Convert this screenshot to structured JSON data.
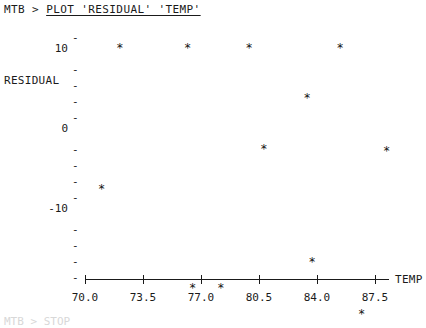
{
  "header": {
    "prompt": "MTB > ",
    "command": "PLOT 'RESIDUAL' 'TEMP'"
  },
  "footer": {
    "partial_text": "MTB > STOP"
  },
  "chart_data": {
    "type": "scatter",
    "title": "",
    "subtitle": "",
    "xlabel": "TEMP",
    "ylabel": "RESIDUAL",
    "marker": "*",
    "grid": false,
    "legend": null,
    "xlim": [
      70.0,
      89.0
    ],
    "ylim": [
      -17.0,
      14.0
    ],
    "xticks": [
      "70.0",
      "73.5",
      "77.0",
      "80.5",
      "84.0",
      "87.5"
    ],
    "xtick_values": [
      70.0,
      73.5,
      77.0,
      80.5,
      84.0,
      87.5
    ],
    "ytick_labels": [
      "10",
      "0",
      "-10"
    ],
    "ytick_values": [
      10,
      0,
      -10
    ],
    "ytick_dash_count": 16,
    "points": [
      {
        "x": 72.1,
        "y": 10.2
      },
      {
        "x": 76.2,
        "y": 10.2
      },
      {
        "x": 79.9,
        "y": 10.2
      },
      {
        "x": 85.4,
        "y": 10.2
      },
      {
        "x": 83.4,
        "y": 4.0
      },
      {
        "x": 80.8,
        "y": -2.4
      },
      {
        "x": 88.2,
        "y": -2.6
      },
      {
        "x": 71.0,
        "y": -7.4
      },
      {
        "x": 76.5,
        "y": -19.8
      },
      {
        "x": 78.2,
        "y": -19.8
      },
      {
        "x": 83.7,
        "y": -16.5
      },
      {
        "x": 86.7,
        "y": -23.0
      }
    ]
  },
  "colors": {
    "ink": "#1a1a1a",
    "paper": "#ffffff",
    "marker": "#111111"
  }
}
